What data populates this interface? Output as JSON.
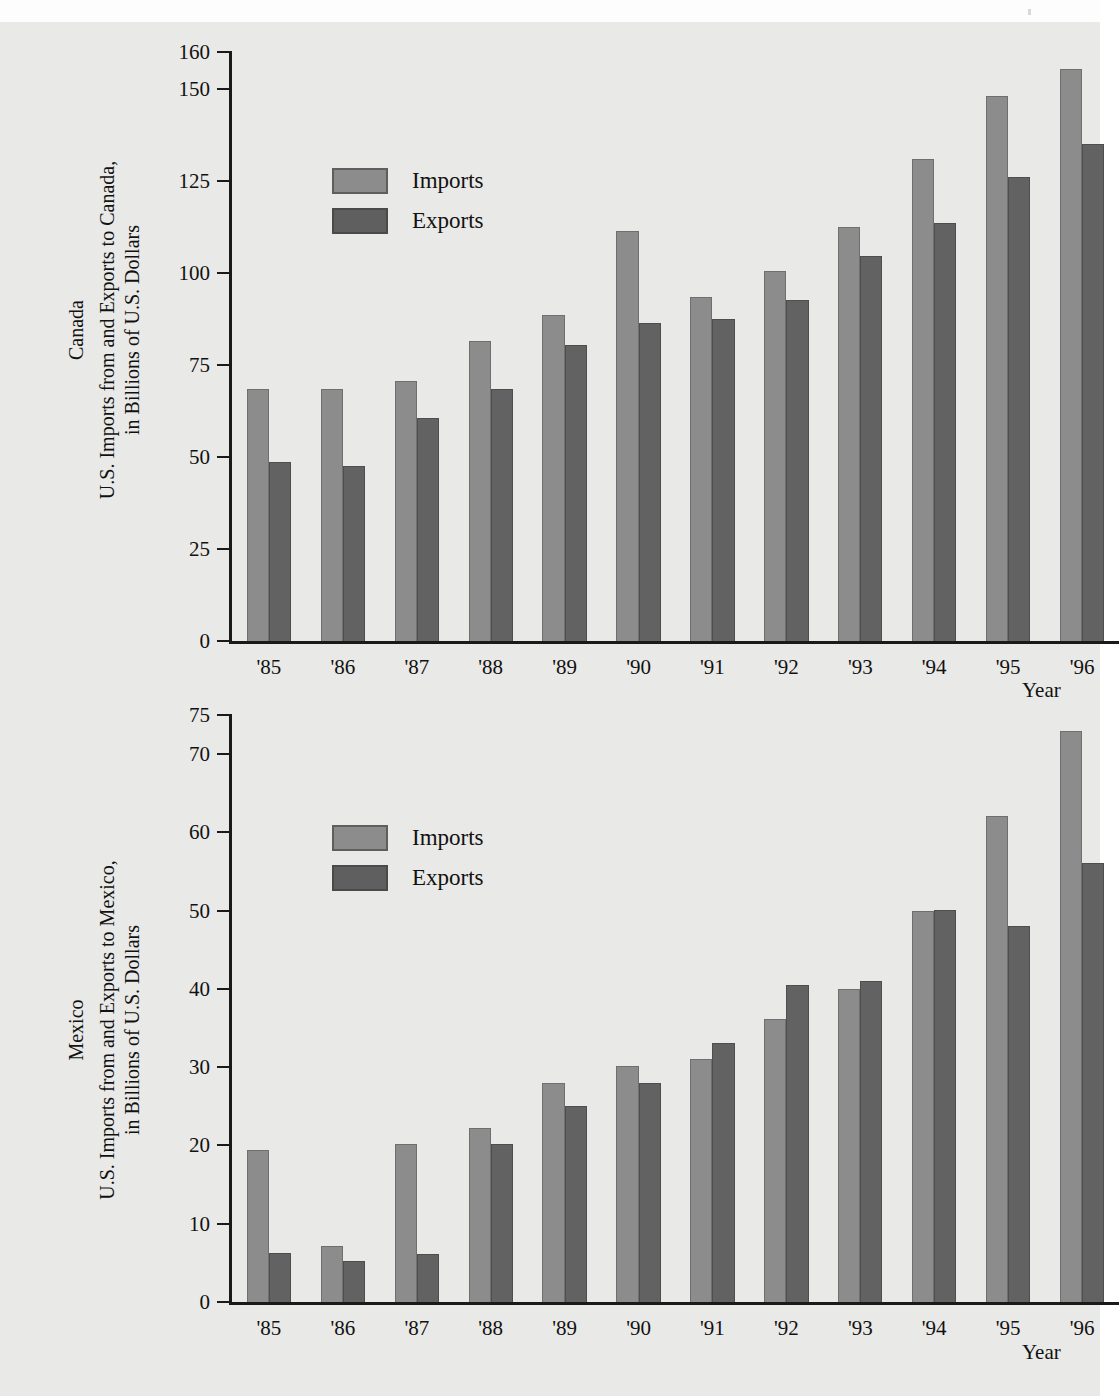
{
  "page": {
    "background_color": "#e9e9e7",
    "imports_color": "#8c8c8c",
    "exports_color": "#626262",
    "axis_color": "#1a1a1a"
  },
  "charts": [
    {
      "id": "canada",
      "region_label": "Canada",
      "y_axis_caption_line1": "U.S. Imports from and Exports to Canada,",
      "y_axis_caption_line2": "in Billions of U.S. Dollars",
      "x_axis_title": "Year",
      "legend": [
        {
          "key": "imports",
          "label": "Imports",
          "color": "#8c8c8c"
        },
        {
          "key": "exports",
          "label": "Exports",
          "color": "#626262"
        }
      ],
      "y_ticks": [
        0,
        25,
        50,
        75,
        100,
        125,
        150,
        160
      ],
      "y_max": 160,
      "categories": [
        "'85",
        "'86",
        "'87",
        "'88",
        "'89",
        "'90",
        "'91",
        "'92",
        "'93",
        "'94",
        "'95",
        "'96"
      ],
      "imports": [
        68.5,
        68.5,
        70.5,
        81.5,
        88.5,
        111.5,
        93.5,
        100.5,
        112.5,
        131,
        148,
        155.5
      ],
      "exports": [
        48.5,
        47.5,
        60.5,
        68.5,
        80.5,
        86.5,
        87.5,
        92.5,
        104.5,
        113.5,
        126,
        135
      ]
    },
    {
      "id": "mexico",
      "region_label": "Mexico",
      "y_axis_caption_line1": "U.S. Imports from and Exports to Mexico,",
      "y_axis_caption_line2": "in Billions of U.S. Dollars",
      "x_axis_title": "Year",
      "legend": [
        {
          "key": "imports",
          "label": "Imports",
          "color": "#8c8c8c"
        },
        {
          "key": "exports",
          "label": "Exports",
          "color": "#626262"
        }
      ],
      "y_ticks": [
        0,
        10,
        20,
        30,
        40,
        50,
        60,
        70,
        75
      ],
      "y_max": 75,
      "categories": [
        "'85",
        "'86",
        "'87",
        "'88",
        "'89",
        "'90",
        "'91",
        "'92",
        "'93",
        "'94",
        "'95",
        "'96"
      ],
      "imports": [
        19.4,
        7.2,
        20.2,
        22.2,
        28.0,
        30.1,
        31.1,
        36.1,
        40.0,
        50.0,
        62.1,
        73.0
      ],
      "exports": [
        6.2,
        5.2,
        6.1,
        20.2,
        25.1,
        28.0,
        33.1,
        40.5,
        41.0,
        50.1,
        48.1,
        56.1
      ]
    }
  ],
  "chart_data": [
    {
      "type": "bar",
      "title": "Canada",
      "subtitle": "U.S. Imports from and Exports to Canada, in Billions of U.S. Dollars",
      "xlabel": "Year",
      "ylabel": "U.S. Imports from and Exports to Canada, in Billions of U.S. Dollars",
      "categories": [
        "'85",
        "'86",
        "'87",
        "'88",
        "'89",
        "'90",
        "'91",
        "'92",
        "'93",
        "'94",
        "'95",
        "'96"
      ],
      "series": [
        {
          "name": "Imports",
          "values": [
            68.5,
            68.5,
            70.5,
            81.5,
            88.5,
            111.5,
            93.5,
            100.5,
            112.5,
            131,
            148,
            155.5
          ]
        },
        {
          "name": "Exports",
          "values": [
            48.5,
            47.5,
            60.5,
            68.5,
            80.5,
            86.5,
            87.5,
            92.5,
            104.5,
            113.5,
            126,
            135
          ]
        }
      ],
      "ylim": [
        0,
        160
      ],
      "yticks": [
        0,
        25,
        50,
        75,
        100,
        125,
        150,
        160
      ],
      "grid": false,
      "legend_position": "upper-left-inside"
    },
    {
      "type": "bar",
      "title": "Mexico",
      "subtitle": "U.S. Imports from and Exports to Mexico, in Billions of U.S. Dollars",
      "xlabel": "Year",
      "ylabel": "U.S. Imports from and Exports to Mexico, in Billions of U.S. Dollars",
      "categories": [
        "'85",
        "'86",
        "'87",
        "'88",
        "'89",
        "'90",
        "'91",
        "'92",
        "'93",
        "'94",
        "'95",
        "'96"
      ],
      "series": [
        {
          "name": "Imports",
          "values": [
            19.4,
            7.2,
            20.2,
            22.2,
            28.0,
            30.1,
            31.1,
            36.1,
            40.0,
            50.0,
            62.1,
            73.0
          ]
        },
        {
          "name": "Exports",
          "values": [
            6.2,
            5.2,
            6.1,
            20.2,
            25.1,
            28.0,
            33.1,
            40.5,
            41.0,
            50.1,
            48.1,
            56.1
          ]
        }
      ],
      "ylim": [
        0,
        75
      ],
      "yticks": [
        0,
        10,
        20,
        30,
        40,
        50,
        60,
        70,
        75
      ],
      "grid": false,
      "legend_position": "upper-left-inside"
    }
  ]
}
